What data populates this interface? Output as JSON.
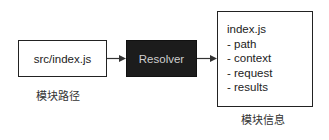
{
  "nodes": {
    "source": {
      "label": "src/index.js",
      "caption": "模块路径"
    },
    "resolver": {
      "label": "Resolver"
    },
    "info": {
      "title": "index.js",
      "fields": [
        "- path",
        "- context",
        "- request",
        "- results"
      ],
      "caption": "模块信息"
    }
  },
  "edges": [
    {
      "from": "source",
      "to": "resolver"
    },
    {
      "from": "resolver",
      "to": "info"
    }
  ],
  "colors": {
    "resolver_fill": "#1c1c1c",
    "resolver_text": "#cfcfcf",
    "stroke": "#222222"
  }
}
